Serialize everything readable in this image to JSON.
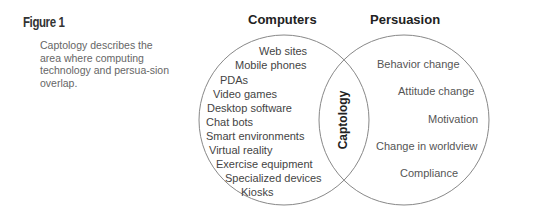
{
  "figure": {
    "label": "Figure 1",
    "caption": "Captology describes the area where computing technology and persua-sion overlap."
  },
  "venn": {
    "left": {
      "title": "Computers",
      "items": [
        "Web sites",
        "Mobile phones",
        "PDAs",
        "Video games",
        "Desktop software",
        "Chat bots",
        "Smart environments",
        "Virtual reality",
        "Exercise equipment",
        "Specialized devices",
        "Kiosks"
      ]
    },
    "right": {
      "title": "Persuasion",
      "items": [
        "Behavior change",
        "Attitude change",
        "Motivation",
        "Change in worldview",
        "Compliance"
      ]
    },
    "overlap": {
      "label": "Captology"
    },
    "colors": {
      "stroke": "#888888",
      "text": "#444444",
      "heading": "#222222"
    }
  }
}
